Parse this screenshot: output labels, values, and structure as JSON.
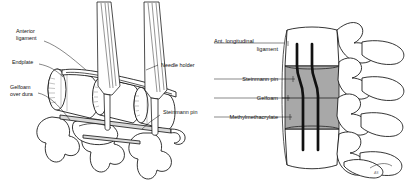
{
  "figure": {
    "background_color": "#ffffff",
    "ink_color": "#111111",
    "graft_fill_color": "#a8a8a8",
    "pin_color": "#111111"
  },
  "panels": [
    {
      "id": "left",
      "name": "intraoperative-view",
      "labels": [
        {
          "id": "anterior-ligament",
          "line1": "Anterior",
          "line2": "ligament"
        },
        {
          "id": "endplate",
          "line1": "Endplate",
          "line2": ""
        },
        {
          "id": "gelfoam-over-dura",
          "line1": "Gelfoam",
          "line2": "over dura"
        },
        {
          "id": "needle-holder",
          "line1": "Needle holder",
          "line2": ""
        },
        {
          "id": "steinmann-pin",
          "line1": "Steinmann pin",
          "line2": ""
        }
      ]
    },
    {
      "id": "right",
      "name": "lateral-reconstruction-view",
      "labels": [
        {
          "id": "ant-longitudinal-ligament",
          "line1": "Ant. longitudinal",
          "line2": "ligament"
        },
        {
          "id": "steinmann-pin",
          "line1": "Steinmann pin",
          "line2": ""
        },
        {
          "id": "gelfoam",
          "line1": "Gelfoam",
          "line2": ""
        },
        {
          "id": "methylmethacrylate",
          "line1": "Methylmethacrylate",
          "line2": ""
        }
      ],
      "signature": "AS"
    }
  ]
}
